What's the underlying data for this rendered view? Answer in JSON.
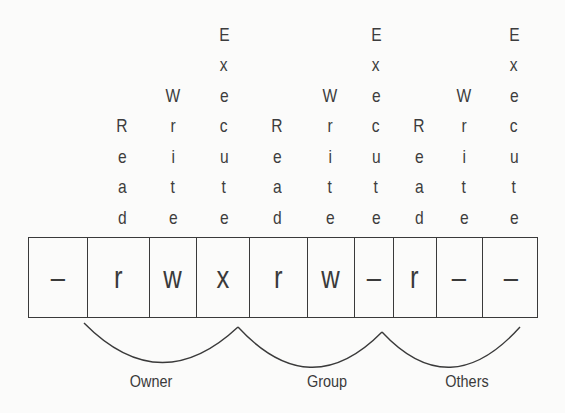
{
  "columns": [
    {
      "label": "Read",
      "x": 122
    },
    {
      "label": "Write",
      "x": 173
    },
    {
      "label": "Execute",
      "x": 224
    },
    {
      "label": "Read",
      "x": 277
    },
    {
      "label": "Write",
      "x": 330
    },
    {
      "label": "Execute",
      "x": 376
    },
    {
      "label": "Read",
      "x": 419
    },
    {
      "label": "Write",
      "x": 464
    },
    {
      "label": "Execute",
      "x": 514
    }
  ],
  "permission_string": "-rwxrw-r--",
  "cells": [
    {
      "value": "–",
      "meaning": "file type",
      "left": 0,
      "width": 58
    },
    {
      "value": "r",
      "meaning": "owner read",
      "left": 58,
      "width": 62
    },
    {
      "value": "w",
      "meaning": "owner write",
      "left": 120,
      "width": 47
    },
    {
      "value": "x",
      "meaning": "owner execute",
      "left": 167,
      "width": 53
    },
    {
      "value": "r",
      "meaning": "group read",
      "left": 220,
      "width": 58
    },
    {
      "value": "w",
      "meaning": "group write",
      "left": 278,
      "width": 47
    },
    {
      "value": "–",
      "meaning": "group execute",
      "left": 325,
      "width": 39
    },
    {
      "value": "r",
      "meaning": "others read",
      "left": 364,
      "width": 43
    },
    {
      "value": "–",
      "meaning": "others write",
      "left": 407,
      "width": 46
    },
    {
      "value": "–",
      "meaning": "others execute",
      "left": 453,
      "width": 57
    }
  ],
  "groups": [
    {
      "label": "Owner",
      "x": 151,
      "path": "M 84 323 Q 160 400 238 327"
    },
    {
      "label": "Group",
      "x": 327,
      "path": "M 238 327 Q 310 405 382 332"
    },
    {
      "label": "Others",
      "x": 467,
      "path": "M 382 332 Q 450 405 520 327"
    }
  ],
  "colors": {
    "ink": "#3a3a3a",
    "paper": "#fbfbfa"
  }
}
